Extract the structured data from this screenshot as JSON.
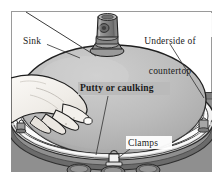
{
  "figure": {
    "kind": "technical-illustration",
    "frame": {
      "border_color": "#9a9a9a",
      "background_color": "#ffffff"
    },
    "colors": {
      "countertop": "#8f8f8f",
      "countertop_edge": "#6d6d6d",
      "sink_dome": "#b9b9b9",
      "sink_dome_highlight": "#c9c9c9",
      "sink_rim": "#f2f2f2",
      "hand": "#f0eeea",
      "outline": "#2b2b2b",
      "label_text": "#1a1a1a",
      "leader_line": "#3a3a3a"
    },
    "labels": [
      {
        "id": "sink",
        "text": "Sink",
        "name": "label-sink"
      },
      {
        "id": "underside",
        "text": "Underside of\ncountertop",
        "line1": "Underside of",
        "line2": "countertop",
        "name": "label-underside"
      },
      {
        "id": "putty",
        "text": "Putty or caulking",
        "name": "label-putty"
      },
      {
        "id": "clamps",
        "text": "Clamps",
        "name": "label-clamps"
      }
    ],
    "parts": [
      {
        "id": "drain-fitting",
        "label": "drain tailpiece fitting"
      },
      {
        "id": "sink-bowl",
        "label": "sink bowl dome"
      },
      {
        "id": "sink-rim",
        "label": "sink rim flange"
      },
      {
        "id": "hand",
        "label": "hand pressing sink into place"
      },
      {
        "id": "clamp-left",
        "label": "left mounting clamp"
      },
      {
        "id": "clamp-right",
        "label": "right mounting clamp"
      },
      {
        "id": "clamp-front",
        "label": "front mounting clamp"
      },
      {
        "id": "cutout-holes",
        "label": "countertop clamp slots",
        "count": 3
      }
    ]
  }
}
